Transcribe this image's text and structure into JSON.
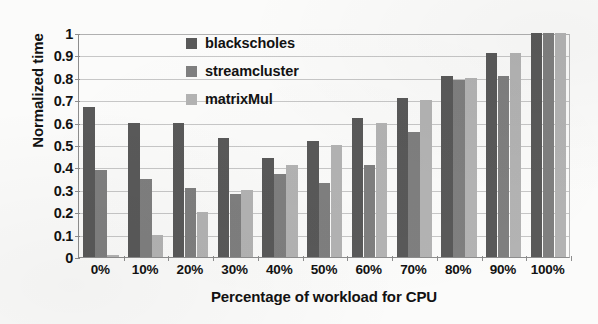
{
  "chart_data": {
    "type": "bar",
    "title": "",
    "xlabel": "Percentage of workload for CPU",
    "ylabel": "Normalized time",
    "categories": [
      "0%",
      "10%",
      "20%",
      "30%",
      "40%",
      "50%",
      "60%",
      "70%",
      "80%",
      "90%",
      "100%"
    ],
    "ylim": [
      0,
      1
    ],
    "ytick_labels": [
      "0",
      "0.1",
      "0.2",
      "0.3",
      "0.4",
      "0.5",
      "0.6",
      "0.7",
      "0.8",
      "0.9",
      "1"
    ],
    "ytick_values": [
      0,
      0.1,
      0.2,
      0.3,
      0.4,
      0.5,
      0.6,
      0.7,
      0.8,
      0.9,
      1
    ],
    "grid": true,
    "legend_position": "top-center",
    "series": [
      {
        "name": "blackscholes",
        "color": "#595959",
        "values": [
          0.67,
          0.6,
          0.6,
          0.53,
          0.44,
          0.52,
          0.62,
          0.71,
          0.81,
          0.91,
          1.0
        ]
      },
      {
        "name": "streamcluster",
        "color": "#7f7f7f",
        "values": [
          0.39,
          0.35,
          0.31,
          0.28,
          0.37,
          0.33,
          0.41,
          0.56,
          0.79,
          0.81,
          1.0
        ]
      },
      {
        "name": "matrixMul",
        "color": "#b3b3b3",
        "values": [
          0.01,
          0.1,
          0.2,
          0.3,
          0.41,
          0.5,
          0.6,
          0.7,
          0.8,
          0.91,
          1.0
        ]
      }
    ]
  }
}
